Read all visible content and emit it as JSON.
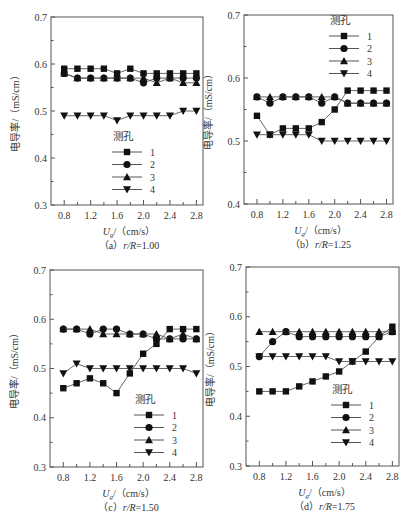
{
  "figure": {
    "ylabel": "电导率/（mS/cm）",
    "xlabel_main": "U",
    "xlabel_sub": "g",
    "xlabel_unit": "/（cm/s）",
    "legend_title": "测孔",
    "legend_labels": [
      "1",
      "2",
      "3",
      "4"
    ],
    "markers": [
      "square",
      "circle",
      "triangle-up",
      "triangle-down"
    ],
    "line_color": "#555555",
    "marker_color": "#111111"
  },
  "chart_data": [
    {
      "type": "line",
      "panel": "a",
      "caption_prefix": "（a）",
      "caption_var": "r/R",
      "caption_value": "=1.00",
      "xlabel": "Ug/（cm/s）",
      "ylabel": "电导率/（mS/cm）",
      "x": [
        0.8,
        1.0,
        1.2,
        1.4,
        1.6,
        1.8,
        2.0,
        2.2,
        2.4,
        2.6,
        2.8
      ],
      "xticks": [
        0.8,
        1.2,
        1.6,
        2.0,
        2.4,
        2.8
      ],
      "ylim": [
        0.3,
        0.7
      ],
      "yticks": [
        0.3,
        0.4,
        0.5,
        0.6,
        0.7
      ],
      "legend_position": "lower-center",
      "series": [
        {
          "name": "1",
          "values": [
            0.59,
            0.59,
            0.59,
            0.59,
            0.58,
            0.59,
            0.58,
            0.58,
            0.58,
            0.58,
            0.58
          ]
        },
        {
          "name": "2",
          "values": [
            0.58,
            0.57,
            0.57,
            0.57,
            0.57,
            0.57,
            0.56,
            0.57,
            0.57,
            0.57,
            0.57
          ]
        },
        {
          "name": "3",
          "values": [
            0.58,
            0.57,
            0.57,
            0.57,
            0.57,
            0.57,
            0.57,
            0.56,
            0.57,
            0.56,
            0.56
          ]
        },
        {
          "name": "4",
          "values": [
            0.49,
            0.49,
            0.49,
            0.49,
            0.48,
            0.49,
            0.49,
            0.49,
            0.49,
            0.5,
            0.5
          ]
        }
      ]
    },
    {
      "type": "line",
      "panel": "b",
      "caption_prefix": "（b）",
      "caption_var": "r/R",
      "caption_value": "=1.25",
      "xlabel": "Ug/（cm/s）",
      "ylabel": "电导率/（mS/cm）",
      "x": [
        0.8,
        1.0,
        1.2,
        1.4,
        1.6,
        1.8,
        2.0,
        2.2,
        2.4,
        2.6,
        2.8
      ],
      "xticks": [
        0.8,
        1.2,
        1.6,
        2.0,
        2.4,
        2.8
      ],
      "ylim": [
        0.4,
        0.7
      ],
      "yticks": [
        0.4,
        0.5,
        0.6,
        0.7
      ],
      "legend_position": "upper-right",
      "series": [
        {
          "name": "1",
          "values": [
            0.54,
            0.51,
            0.52,
            0.52,
            0.52,
            0.53,
            0.55,
            0.58,
            0.58,
            0.58,
            0.58
          ]
        },
        {
          "name": "2",
          "values": [
            0.57,
            0.56,
            0.57,
            0.57,
            0.57,
            0.56,
            0.57,
            0.56,
            0.56,
            0.56,
            0.56
          ]
        },
        {
          "name": "3",
          "values": [
            0.57,
            0.57,
            0.57,
            0.57,
            0.57,
            0.57,
            0.57,
            0.56,
            0.56,
            0.56,
            0.56
          ]
        },
        {
          "name": "4",
          "values": [
            0.51,
            0.51,
            0.51,
            0.51,
            0.51,
            0.5,
            0.5,
            0.5,
            0.5,
            0.5,
            0.5
          ]
        }
      ]
    },
    {
      "type": "line",
      "panel": "c",
      "caption_prefix": "（c）",
      "caption_var": "r/R",
      "caption_value": "=1.50",
      "xlabel": "Ug/（cm/s）",
      "ylabel": "电导率/（mS/cm）",
      "x": [
        0.8,
        1.0,
        1.2,
        1.4,
        1.6,
        1.8,
        2.0,
        2.2,
        2.4,
        2.6,
        2.8
      ],
      "xticks": [
        0.8,
        1.2,
        1.6,
        2.0,
        2.4,
        2.8
      ],
      "ylim": [
        0.3,
        0.7
      ],
      "yticks": [
        0.3,
        0.4,
        0.5,
        0.6,
        0.7
      ],
      "legend_position": "lower-right",
      "series": [
        {
          "name": "1",
          "values": [
            0.46,
            0.47,
            0.48,
            0.47,
            0.45,
            0.49,
            0.53,
            0.55,
            0.58,
            0.58,
            0.58
          ]
        },
        {
          "name": "2",
          "values": [
            0.58,
            0.58,
            0.57,
            0.58,
            0.58,
            0.57,
            0.57,
            0.56,
            0.56,
            0.56,
            0.56
          ]
        },
        {
          "name": "3",
          "values": [
            0.58,
            0.58,
            0.58,
            0.57,
            0.57,
            0.57,
            0.57,
            0.57,
            0.56,
            0.57,
            0.56
          ]
        },
        {
          "name": "4",
          "values": [
            0.49,
            0.51,
            0.5,
            0.5,
            0.5,
            0.5,
            0.5,
            0.5,
            0.5,
            0.5,
            0.49
          ]
        }
      ]
    },
    {
      "type": "line",
      "panel": "d",
      "caption_prefix": "（d）",
      "caption_var": "r/R",
      "caption_value": "=1.75",
      "xlabel": "Ug/（cm/s）",
      "ylabel": "电导率/（mS/cm）",
      "x": [
        0.8,
        1.0,
        1.2,
        1.4,
        1.6,
        1.8,
        2.0,
        2.2,
        2.4,
        2.6,
        2.8
      ],
      "xticks": [
        0.8,
        1.2,
        1.6,
        2.0,
        2.4,
        2.8
      ],
      "ylim": [
        0.3,
        0.7
      ],
      "yticks": [
        0.3,
        0.4,
        0.5,
        0.6,
        0.7
      ],
      "legend_position": "lower-right",
      "series": [
        {
          "name": "1",
          "values": [
            0.45,
            0.45,
            0.45,
            0.46,
            0.47,
            0.48,
            0.49,
            0.51,
            0.53,
            0.56,
            0.58
          ]
        },
        {
          "name": "2",
          "values": [
            0.52,
            0.55,
            0.57,
            0.56,
            0.56,
            0.56,
            0.56,
            0.56,
            0.56,
            0.56,
            0.57
          ]
        },
        {
          "name": "3",
          "values": [
            0.57,
            0.57,
            0.57,
            0.57,
            0.57,
            0.57,
            0.57,
            0.57,
            0.57,
            0.57,
            0.57
          ]
        },
        {
          "name": "4",
          "values": [
            0.52,
            0.52,
            0.52,
            0.52,
            0.52,
            0.52,
            0.51,
            0.51,
            0.51,
            0.51,
            0.51
          ]
        }
      ]
    }
  ],
  "layout": {
    "panels": [
      {
        "left": 51,
        "top": 17,
        "right": 203,
        "bottom": 205,
        "legend": {
          "x": 118,
          "y": 140
        }
      },
      {
        "left": 244,
        "top": 15,
        "right": 393,
        "bottom": 204,
        "legend": {
          "x": 335,
          "y": 24
        }
      },
      {
        "left": 50,
        "top": 270,
        "right": 203,
        "bottom": 467,
        "legend": {
          "x": 140,
          "y": 403
        }
      },
      {
        "left": 246,
        "top": 267,
        "right": 399,
        "bottom": 466,
        "legend": {
          "x": 337,
          "y": 393
        }
      }
    ]
  }
}
